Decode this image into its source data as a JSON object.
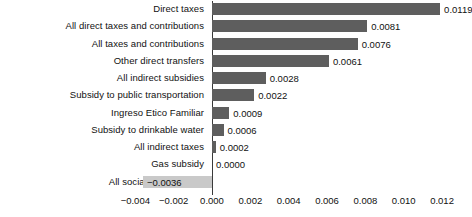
{
  "chart_data": {
    "type": "bar",
    "orientation": "horizontal",
    "title": "",
    "xlabel": "",
    "ylabel": "",
    "grid": false,
    "legend": false,
    "xlim": [
      -0.005,
      0.0128
    ],
    "xticks": [
      -0.004,
      -0.002,
      0.0,
      0.002,
      0.004,
      0.006,
      0.008,
      0.01,
      0.012
    ],
    "xtick_labels": [
      "−0.004",
      "−0.002",
      "0.000",
      "0.002",
      "0.004",
      "0.006",
      "0.008",
      "0.010",
      "0.012"
    ],
    "categories": [
      "Direct taxes",
      "All direct taxes and contributions",
      "All taxes and contributions",
      "Other direct transfers",
      "All indirect subsidies",
      "Subsidy to public transportation",
      "Ingreso Etico Familiar",
      "Subsidy to drinkable water",
      "All indirect taxes",
      "Gas subsidy",
      "All social contributions"
    ],
    "values": [
      0.0119,
      0.0081,
      0.0076,
      0.0061,
      0.0028,
      0.0022,
      0.0009,
      0.0006,
      0.0002,
      0.0,
      -0.0036
    ],
    "value_labels": [
      "0.0119",
      "0.0081",
      "0.0076",
      "0.0061",
      "0.0028",
      "0.0022",
      "0.0009",
      "0.0006",
      "0.0002",
      "0.0000",
      "−0.0036"
    ],
    "colors": {
      "bar_positive": "#5e5e5e",
      "bar_negative": "#c9c9c9",
      "axis": "#3a3a3a",
      "text": "#111111",
      "background": "#ffffff"
    }
  }
}
